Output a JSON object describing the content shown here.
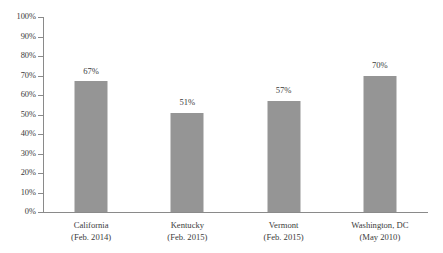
{
  "chart_data": {
    "type": "bar",
    "title": "",
    "subtitle": "",
    "xlabel": "",
    "ylabel": "",
    "categories": [
      "California (Feb. 2014)",
      "Kentucky (Feb. 2015)",
      "Vermont (Feb. 2015)",
      "Washington, DC (May 2010)"
    ],
    "category_lines": [
      [
        "California",
        "(Feb. 2014)"
      ],
      [
        "Kentucky",
        "(Feb. 2015)"
      ],
      [
        "Vermont",
        "(Feb. 2015)"
      ],
      [
        "Washington, DC",
        "(May 2010)"
      ]
    ],
    "values": [
      67,
      51,
      57,
      70
    ],
    "value_labels": [
      "67%",
      "51%",
      "57%",
      "70%"
    ],
    "ylim": [
      0,
      100
    ],
    "ytick_values": [
      0,
      10,
      20,
      30,
      40,
      50,
      60,
      70,
      80,
      90,
      100
    ],
    "ytick_labels": [
      "0%",
      "10%",
      "20%",
      "30%",
      "40%",
      "50%",
      "60%",
      "70%",
      "80%",
      "90%",
      "100%"
    ],
    "grid": false,
    "legend": "none",
    "bar_color": "#959595",
    "axis_color": "#8a8a8a",
    "text_color": "#3b3b3b",
    "background_color": "#ffffff"
  }
}
